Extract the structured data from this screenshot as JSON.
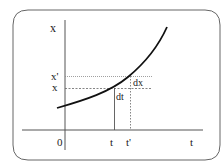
{
  "diagram": {
    "labels": {
      "y_axis": "x",
      "x_axis": "t",
      "origin": "0",
      "x_value": "x",
      "x_prime": "x'",
      "t_value": "t",
      "t_prime": "t'",
      "dx": "dx",
      "dt": "dt"
    },
    "colors": {
      "frame": "#555555",
      "axis": "#555555",
      "curve": "#111111",
      "guide": "#666666"
    }
  }
}
